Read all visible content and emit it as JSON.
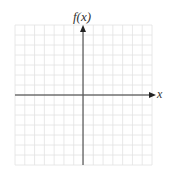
{
  "chart_data": {
    "type": "line",
    "title": "",
    "xlabel": "x",
    "ylabel": "f(x)",
    "series": [],
    "grid": true,
    "grid_cells": {
      "columns": 14,
      "rows": 14
    },
    "origin_cell": {
      "column": 7,
      "row": 7
    },
    "axes": {
      "x_arrow": true,
      "y_arrow": true
    },
    "legend": null
  },
  "labels": {
    "y_axis": "f(x)",
    "x_axis": "x"
  },
  "colors": {
    "grid": "#e4e4e4",
    "axis": "#333333",
    "background": "#ffffff"
  }
}
